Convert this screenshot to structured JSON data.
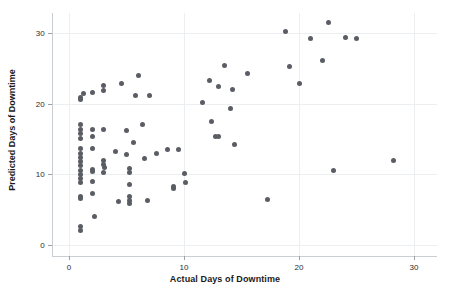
{
  "chart_data": {
    "type": "scatter",
    "title": "",
    "xlabel": "Actual Days of Downtime",
    "ylabel": "Predicted Days of Downtime",
    "xlim": [
      -1.5,
      32.0
    ],
    "ylim": [
      -1.6,
      32.8
    ],
    "xticks": [
      0,
      10,
      20,
      30
    ],
    "xticklabels": [
      "0",
      "10",
      "20",
      "30"
    ],
    "yticks": [
      0,
      10,
      20,
      30
    ],
    "yticklabels": [
      "0",
      "10",
      "20",
      "30"
    ],
    "grid": true,
    "grid_color": "#eceff1",
    "legend": null,
    "marker": {
      "shape": "circle",
      "color": "#5a5d63",
      "size_px": 5
    },
    "series": [
      {
        "name": "Predicted vs Actual Downtime",
        "points": [
          [
            1.0,
            20.9
          ],
          [
            1.0,
            20.6
          ],
          [
            1.0,
            17.1
          ],
          [
            1.0,
            16.4
          ],
          [
            1.0,
            15.8
          ],
          [
            1.0,
            15.1
          ],
          [
            1.0,
            13.6
          ],
          [
            1.0,
            13.0
          ],
          [
            1.0,
            12.4
          ],
          [
            1.0,
            11.8
          ],
          [
            1.0,
            11.2
          ],
          [
            1.0,
            10.6
          ],
          [
            1.0,
            10.0
          ],
          [
            1.0,
            9.4
          ],
          [
            1.0,
            8.8
          ],
          [
            1.0,
            6.9
          ],
          [
            1.0,
            6.6
          ],
          [
            1.0,
            2.6
          ],
          [
            1.0,
            2.0
          ],
          [
            1.3,
            21.4
          ],
          [
            2.0,
            21.5
          ],
          [
            2.0,
            16.3
          ],
          [
            2.0,
            15.4
          ],
          [
            2.0,
            13.7
          ],
          [
            2.0,
            10.7
          ],
          [
            2.0,
            10.4
          ],
          [
            2.0,
            9.0
          ],
          [
            2.0,
            7.3
          ],
          [
            2.2,
            4.0
          ],
          [
            3.0,
            22.5
          ],
          [
            3.0,
            21.9
          ],
          [
            3.0,
            16.3
          ],
          [
            3.0,
            12.0
          ],
          [
            3.0,
            11.4
          ],
          [
            3.0,
            10.2
          ],
          [
            3.1,
            10.9
          ],
          [
            4.0,
            13.2
          ],
          [
            4.3,
            6.1
          ],
          [
            4.6,
            22.9
          ],
          [
            5.0,
            16.2
          ],
          [
            5.0,
            12.8
          ],
          [
            5.3,
            10.8
          ],
          [
            5.3,
            10.2
          ],
          [
            5.3,
            8.6
          ],
          [
            5.3,
            6.9
          ],
          [
            5.3,
            6.3
          ],
          [
            5.3,
            5.9
          ],
          [
            5.6,
            14.5
          ],
          [
            5.8,
            21.1
          ],
          [
            6.0,
            24.0
          ],
          [
            6.4,
            17.1
          ],
          [
            6.6,
            12.3
          ],
          [
            6.8,
            6.3
          ],
          [
            7.0,
            21.1
          ],
          [
            7.6,
            12.9
          ],
          [
            8.6,
            13.5
          ],
          [
            9.1,
            8.3
          ],
          [
            9.1,
            8.0
          ],
          [
            9.5,
            13.5
          ],
          [
            10.0,
            10.1
          ],
          [
            10.1,
            8.8
          ],
          [
            11.6,
            20.2
          ],
          [
            12.2,
            23.2
          ],
          [
            12.4,
            17.5
          ],
          [
            12.7,
            15.4
          ],
          [
            13.0,
            22.4
          ],
          [
            13.0,
            15.3
          ],
          [
            13.5,
            25.4
          ],
          [
            14.0,
            19.3
          ],
          [
            14.2,
            22.0
          ],
          [
            14.4,
            14.2
          ],
          [
            15.5,
            24.3
          ],
          [
            17.3,
            6.4
          ],
          [
            18.8,
            30.2
          ],
          [
            19.2,
            25.3
          ],
          [
            20.0,
            22.9
          ],
          [
            21.0,
            29.2
          ],
          [
            22.0,
            26.1
          ],
          [
            22.6,
            31.5
          ],
          [
            23.0,
            10.5
          ],
          [
            24.0,
            29.3
          ],
          [
            25.0,
            29.2
          ],
          [
            28.2,
            11.9
          ]
        ]
      }
    ]
  }
}
